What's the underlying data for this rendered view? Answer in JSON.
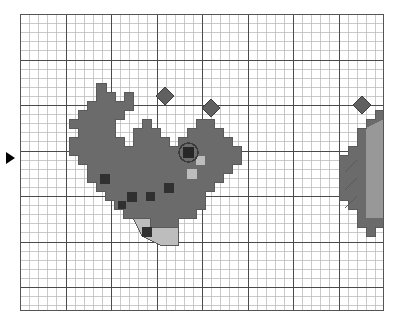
{
  "app": {
    "title": "Pixel Grid Sprite Editor",
    "kind": "pixel-art-grid-canvas"
  },
  "canvas": {
    "origin_x": 20,
    "origin_y": 14,
    "width": 364,
    "height": 297,
    "cell_size": 9.1,
    "cols": 40,
    "rows": 33,
    "major_every": 5,
    "background_color": "#ffffff",
    "minor_grid_color": "#b9b9b9",
    "major_grid_color": "#4a4a4a",
    "border_color": "#555555",
    "grid_visible": true
  },
  "palette": {
    "body": "#6b6b6b",
    "body_outline": "#5a5a5a",
    "spot": "#303030",
    "highlight": "#bdbdbd",
    "eye_pupil": "#272727",
    "eye_ring": "#3a3a3a",
    "bubble": "#606060",
    "bubble_outline": "#3d3d3d",
    "marker": "#000000"
  },
  "row_marker": {
    "name": "row-marker",
    "glyph": "▶",
    "x": 6,
    "y": 152,
    "points_to_row": 16
  },
  "sprites": [
    {
      "id": "whale-main",
      "label": "whale",
      "fill": "#6b6b6b",
      "origin_col": 6,
      "origin_row": 7,
      "body_path": "M 96,83 L 96,101 L 87,101 L 87,110 L 78,110 L 78,119 L 69,119 L 69,128 L 78,128 L 78,137 L 69,137 L 69,155 L 78,155 L 78,164 L 87,164 L 87,182 L 96,182 L 96,191 L 105,191 L 105,200 L 114,200 L 114,209 L 123,209 L 123,218 L 150,218 L 150,227 L 178,227 L 178,218 L 196,218 L 196,209 L 205,209 L 205,191 L 214,191 L 214,182 L 223,182 L 223,173 L 232,173 L 232,164 L 241,164 L 241,146 L 232,146 L 232,137 L 223,137 L 223,128 L 214,128 L 214,119 L 196,119 L 196,128 L 187,128 L 187,137 L 178,137 L 178,146 L 169,146 L 169,137 L 160,137 L 160,128 L 151,128 L 151,119 L 142,119 L 142,128 L 133,128 L 133,146 L 124,146 L 124,137 L 115,137 L 115,119 L 124,119 L 124,110 L 133,110 L 133,92 L 124,92 L 124,101 L 115,101 L 115,92 L 106,92 L 106,83 Z",
      "dorsal_fin": {
        "x": 124,
        "y": 128,
        "w": 18,
        "h": 27
      },
      "spots": [
        {
          "col": 11,
          "row": 19,
          "x": 100,
          "y": 174,
          "size": 10
        },
        {
          "col": 14,
          "row": 21,
          "x": 127,
          "y": 192,
          "size": 10
        },
        {
          "col": 16,
          "row": 21,
          "x": 146,
          "y": 192,
          "size": 9
        },
        {
          "col": 18,
          "row": 20,
          "x": 164,
          "y": 183,
          "size": 10
        },
        {
          "col": 12,
          "row": 22,
          "x": 118,
          "y": 201,
          "size": 8
        }
      ],
      "eye": {
        "x": 183,
        "y": 147,
        "pupil_size": 11,
        "ring_size": 19
      },
      "highlights": [
        {
          "x": 196,
          "y": 156,
          "w": 9,
          "h": 9
        },
        {
          "x": 187,
          "y": 169,
          "w": 10,
          "h": 10
        }
      ],
      "belly_fin": {
        "path": "M 133,218 L 142,236 L 160,245 L 178,245 L 178,227 L 150,227 L 150,218 Z",
        "fill": "#bdbdbd",
        "spot": {
          "x": 142,
          "y": 227,
          "size": 10
        }
      }
    },
    {
      "id": "creature-right-partial",
      "label": "partial creature at right edge",
      "fill": "#6b6b6b",
      "clipped": true,
      "body_path": "M 384,110 L 375,110 L 375,119 L 366,119 L 366,128 L 357,128 L 357,146 L 348,146 L 348,155 L 339,155 L 339,200 L 348,200 L 348,209 L 357,209 L 357,227 L 366,227 L 366,236 L 375,236 L 375,227 L 384,227 Z",
      "shade_path": "M 366,128 L 366,218 L 384,218 L 384,119 Z",
      "shade_fill": "#a0a0a0",
      "slashes": [
        {
          "x1": 345,
          "y1": 172,
          "x2": 357,
          "y2": 160
        },
        {
          "x1": 345,
          "y1": 190,
          "x2": 357,
          "y2": 178
        },
        {
          "x1": 345,
          "y1": 208,
          "x2": 357,
          "y2": 196
        }
      ]
    }
  ],
  "bubbles": [
    {
      "id": "bubble-1",
      "cx": 165,
      "cy": 96,
      "r": 9
    },
    {
      "id": "bubble-2",
      "cx": 211,
      "cy": 108,
      "r": 9
    },
    {
      "id": "bubble-3",
      "cx": 362,
      "cy": 105,
      "r": 9
    }
  ]
}
